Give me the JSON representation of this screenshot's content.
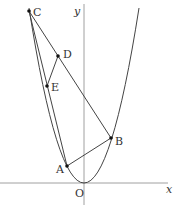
{
  "diagram": {
    "title": "",
    "axes": {
      "x_label": "x",
      "y_label": "y",
      "origin_label": "O"
    },
    "curve": {
      "type": "parabola",
      "description": "y = a x^2, vertex at origin, opening upward"
    },
    "points": [
      {
        "id": "A",
        "label": "A"
      },
      {
        "id": "B",
        "label": "B"
      },
      {
        "id": "C",
        "label": "C"
      },
      {
        "id": "D",
        "label": "D"
      },
      {
        "id": "E",
        "label": "E"
      }
    ],
    "segments": [
      [
        "A",
        "B"
      ],
      [
        "B",
        "C"
      ],
      [
        "C",
        "A"
      ],
      [
        "D",
        "E"
      ]
    ],
    "colors": {
      "line": "#444444",
      "axis": "#888888",
      "point": "#111111",
      "text": "#333333"
    }
  }
}
